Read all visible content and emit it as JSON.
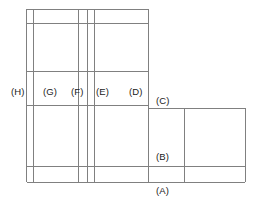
{
  "figure": {
    "title": "",
    "background_color": "#ffffff",
    "line_color": "#808080",
    "line_color_dark": "#6e6e6e",
    "text_color": "#1a1a1a",
    "canvas": {
      "width": 255,
      "height": 206
    }
  },
  "labels": [
    {
      "id": "label-h",
      "text": "(H)",
      "x": 11,
      "y": 87
    },
    {
      "id": "label-g",
      "text": "(G)",
      "x": 43,
      "y": 87
    },
    {
      "id": "label-f",
      "text": "(F)",
      "x": 71,
      "y": 87
    },
    {
      "id": "label-e",
      "text": "(E)",
      "x": 96,
      "y": 87
    },
    {
      "id": "label-d",
      "text": "(D)",
      "x": 129,
      "y": 87
    },
    {
      "id": "label-c",
      "text": "(C)",
      "x": 156,
      "y": 96
    },
    {
      "id": "label-b",
      "text": "(B)",
      "x": 156,
      "y": 152
    },
    {
      "id": "label-a",
      "text": "(A)",
      "x": 156,
      "y": 186
    }
  ],
  "geometry": {
    "vertical_lines": [
      {
        "id": "v-outer-left",
        "x": 26.5,
        "y1": 9,
        "y2": 182
      },
      {
        "id": "v-inner-left",
        "x": 33,
        "y1": 9,
        "y2": 182
      },
      {
        "id": "v-mid-a",
        "x": 78.5,
        "y1": 9,
        "y2": 182
      },
      {
        "id": "v-mid-b",
        "x": 87,
        "y1": 9,
        "y2": 182
      },
      {
        "id": "v-mid-c",
        "x": 94,
        "y1": 9,
        "y2": 182
      },
      {
        "id": "v-right-upper",
        "x": 148,
        "y1": 9,
        "y2": 182
      },
      {
        "id": "v-right-inner",
        "x": 184,
        "y1": 108,
        "y2": 182
      },
      {
        "id": "v-right-outer",
        "x": 245,
        "y1": 108,
        "y2": 182
      }
    ],
    "horizontal_lines": [
      {
        "id": "h-top",
        "y": 9,
        "x1": 26.5,
        "x2": 148
      },
      {
        "id": "h-top-inner",
        "y": 23,
        "x1": 26.5,
        "x2": 148
      },
      {
        "id": "h-upper-mid",
        "y": 71.5,
        "x1": 26.5,
        "x2": 148
      },
      {
        "id": "h-mid",
        "y": 105,
        "x1": 26.5,
        "x2": 148
      },
      {
        "id": "h-right-top",
        "y": 108,
        "x1": 148,
        "x2": 245
      },
      {
        "id": "h-lower",
        "y": 166,
        "x1": 26.5,
        "x2": 245
      },
      {
        "id": "h-bottom",
        "y": 182,
        "x1": 26.5,
        "x2": 245
      }
    ]
  }
}
